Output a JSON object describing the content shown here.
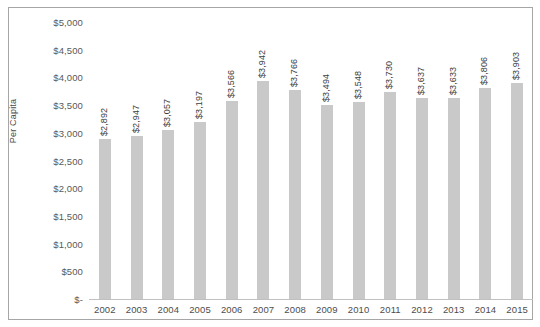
{
  "chart_data": {
    "type": "bar",
    "title": "",
    "xlabel": "",
    "ylabel": "Per Capita",
    "categories": [
      "2002",
      "2003",
      "2004",
      "2005",
      "2006",
      "2007",
      "2008",
      "2009",
      "2010",
      "2011",
      "2012",
      "2013",
      "2014",
      "2015"
    ],
    "values": [
      2892,
      2947,
      3057,
      3197,
      3566,
      3942,
      3766,
      3494,
      3548,
      3730,
      3637,
      3633,
      3806,
      3903
    ],
    "data_labels": [
      "$2,892",
      "$2,947",
      "$3,057",
      "$3,197",
      "$3,566",
      "$3,942",
      "$3,766",
      "$3,494",
      "$3,548",
      "$3,730",
      "$3,637",
      "$3,633",
      "$3,806",
      "$3,903"
    ],
    "ylim": [
      0,
      5000
    ],
    "y_tick_values": [
      5000,
      4500,
      4000,
      3500,
      3000,
      2500,
      2000,
      1500,
      1000,
      500,
      0
    ],
    "y_tick_labels": [
      "$5,000",
      "$4,500",
      "$4,000",
      "$3,500",
      "$3,000",
      "$2,500",
      "$2,000",
      "$1,500",
      "$1,000",
      "$500",
      "$-"
    ],
    "grid": false,
    "legend": null,
    "bar_color": "#c9c9c9",
    "border_color": "#a6a6a6"
  }
}
